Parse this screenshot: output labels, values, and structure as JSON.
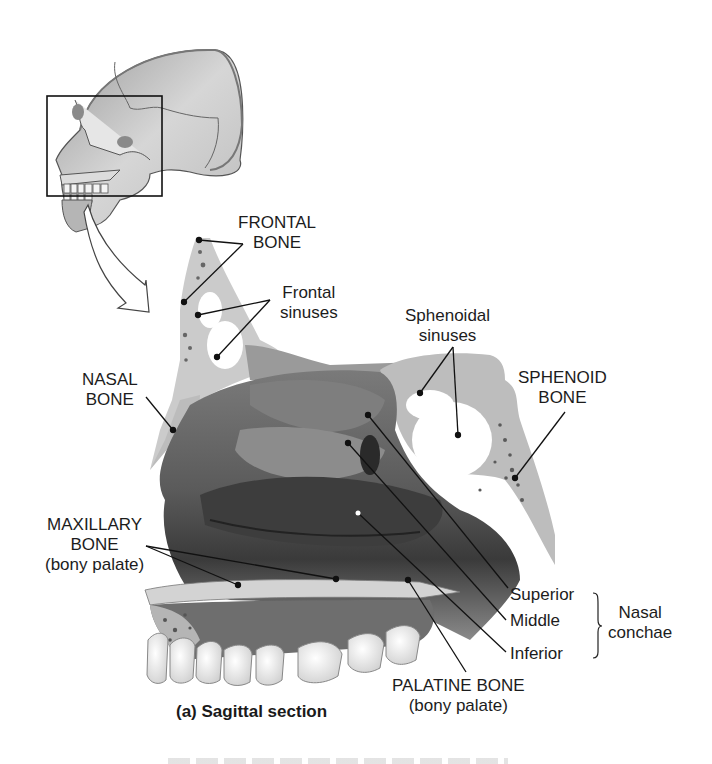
{
  "figure": {
    "caption": "(a) Sagittal section",
    "inset": {
      "description": "lateral view of skull with boxed region indicating nasal area",
      "box_color": "#111111"
    },
    "labels": {
      "frontal_bone": [
        "FRONTAL",
        "BONE"
      ],
      "frontal_sinuses": [
        "Frontal",
        "sinuses"
      ],
      "sphenoidal_sinuses": [
        "Sphenoidal",
        "sinuses"
      ],
      "sphenoid_bone": [
        "SPHENOID",
        "BONE"
      ],
      "nasal_bone": [
        "NASAL",
        "BONE"
      ],
      "maxillary_bone": [
        "MAXILLARY",
        "BONE",
        "(bony palate)"
      ],
      "conchae_superior": "Superior",
      "conchae_middle": "Middle",
      "conchae_inferior": "Inferior",
      "nasal_conchae": [
        "Nasal",
        "conchae"
      ],
      "palatine_bone": [
        "PALATINE BONE",
        "(bony palate)"
      ]
    },
    "colors": {
      "bone": "#c9c9c9",
      "bone_dark": "#8a8a8a",
      "tissue": "#6e6e6e",
      "tissue_dark": "#3a3a3a",
      "sinus": "#ffffff",
      "teeth": "#efefef",
      "leader": "#111111"
    }
  }
}
